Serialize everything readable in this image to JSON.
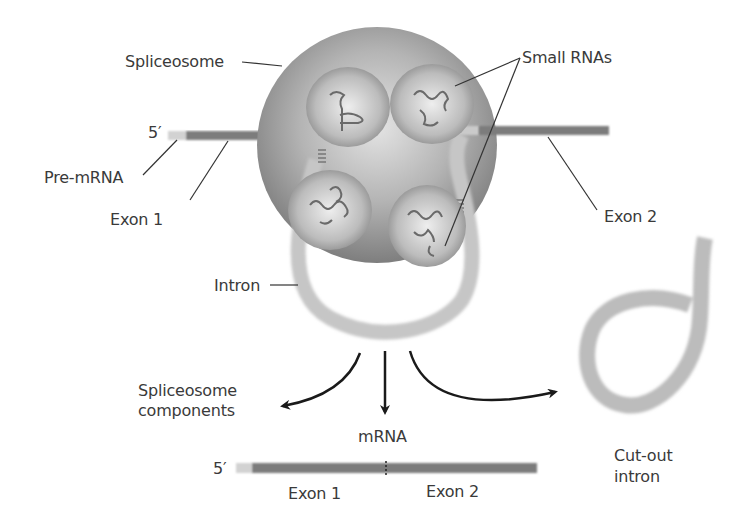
{
  "diagram": {
    "labels": {
      "spliceosome": "Spliceosome",
      "small_rnas": "Small RNAs",
      "five_prime_top": "5′",
      "pre_mrna": "Pre-mRNA",
      "exon1_top": "Exon 1",
      "exon2_top": "Exon 2",
      "intron": "Intron",
      "spliceosome_components_line1": "Spliceosome",
      "spliceosome_components_line2": "components",
      "mrna": "mRNA",
      "five_prime_bottom": "5′",
      "exon1_bottom": "Exon 1",
      "exon2_bottom": "Exon 2",
      "cut_out_intron_line1": "Cut-out",
      "cut_out_intron_line2": "intron"
    },
    "colors": {
      "spliceosome_body": "#8a8a8a",
      "small_rna_particle": "#a8a8a8",
      "exon_strand": "#7c7c7c",
      "intron_strand": "#c4c4c4",
      "five_prime_cap": "#cfcfcf",
      "arrow": "#1a1a1a",
      "leader_line": "#333333",
      "text": "#3a3a3a"
    },
    "arrows": [
      {
        "from": "spliceosome",
        "to": "spliceosome-components"
      },
      {
        "from": "spliceosome",
        "to": "mrna"
      },
      {
        "from": "spliceosome",
        "to": "cut-out-intron"
      }
    ]
  }
}
